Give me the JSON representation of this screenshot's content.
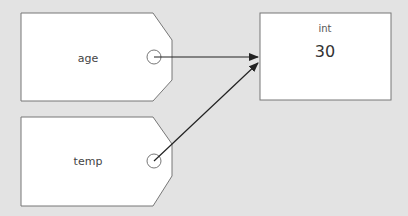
{
  "diagram": {
    "title": "",
    "variables": [
      {
        "name": "age"
      },
      {
        "name": "temp"
      }
    ],
    "object": {
      "type": "int",
      "value": "30"
    },
    "arrows": [
      {
        "from": "age",
        "to": "object"
      },
      {
        "from": "temp",
        "to": "object"
      }
    ],
    "colors": {
      "background": "#e3e3e3",
      "shape_fill": "#ffffff",
      "stroke": "#777777",
      "arrow": "#222222"
    }
  }
}
